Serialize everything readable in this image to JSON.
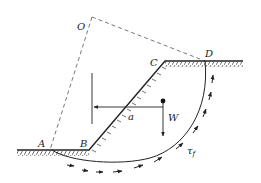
{
  "diagram": {
    "type": "slope-stability-circular-slip",
    "points": {
      "O": "O",
      "A": "A",
      "B": "B",
      "C": "C",
      "D": "D"
    },
    "labels": {
      "weight": "W",
      "lever_arm": "a",
      "shear_strength": "τ",
      "shear_subscript": "f"
    },
    "colors": {
      "line": "#222222",
      "dashed": "#555555",
      "background": "#ffffff"
    }
  }
}
